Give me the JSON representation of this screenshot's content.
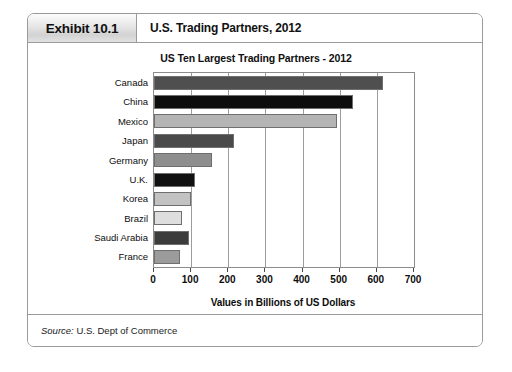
{
  "exhibit": {
    "tag": "Exhibit 10.1",
    "title": "U.S. Trading Partners, 2012",
    "source_word": "Source:",
    "source_text": " U.S. Dept of Commerce"
  },
  "chart_data": {
    "type": "bar",
    "orientation": "horizontal",
    "title": "US Ten Largest Trading Partners - 2012",
    "xlabel": "Values in Billions of US Dollars",
    "ylabel": "",
    "categories": [
      "Canada",
      "China",
      "Mexico",
      "Japan",
      "Germany",
      "U.K.",
      "Korea",
      "Brazil",
      "Saudi Arabia",
      "France"
    ],
    "values": [
      617,
      536,
      494,
      216,
      157,
      111,
      100,
      76,
      95,
      70
    ],
    "bar_colors": [
      "#4f4f4f",
      "#0d0d0d",
      "#b4b4b4",
      "#4a4a4a",
      "#8e8e8e",
      "#111111",
      "#c2c2c2",
      "#dedede",
      "#3c3c3c",
      "#9b9b9b"
    ],
    "xlim": [
      0,
      700
    ],
    "xticks": [
      0,
      100,
      200,
      300,
      400,
      500,
      600,
      700
    ],
    "xtick_labels": [
      "0",
      "100",
      "200",
      "300",
      "400",
      "500",
      "600",
      "700"
    ],
    "grid": true,
    "grid_axis": "x",
    "legend": false
  }
}
